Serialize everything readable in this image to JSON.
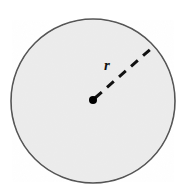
{
  "figure": {
    "background_color": "#ffffff",
    "width": 185,
    "height": 196
  },
  "circle": {
    "name": "circle-shape",
    "center_x": 93,
    "center_y": 101,
    "radius": 82,
    "fill_color": "#f0f0f0",
    "stroke_color": "#555555",
    "stroke_width": 1.6
  },
  "center_point": {
    "name": "center-dot",
    "x": 93,
    "y": 100,
    "diameter": 8,
    "color": "#000000"
  },
  "radius_line": {
    "name": "radius-dashed-line",
    "x1": 95,
    "y1": 98,
    "x2": 153,
    "y2": 47,
    "color": "#111111",
    "stroke_width": 3,
    "dash_pattern": "9 7",
    "style": "dashed"
  },
  "labels": {
    "radius": "r",
    "radius_x": 107,
    "radius_y": 70,
    "radius_color": "#111111"
  }
}
